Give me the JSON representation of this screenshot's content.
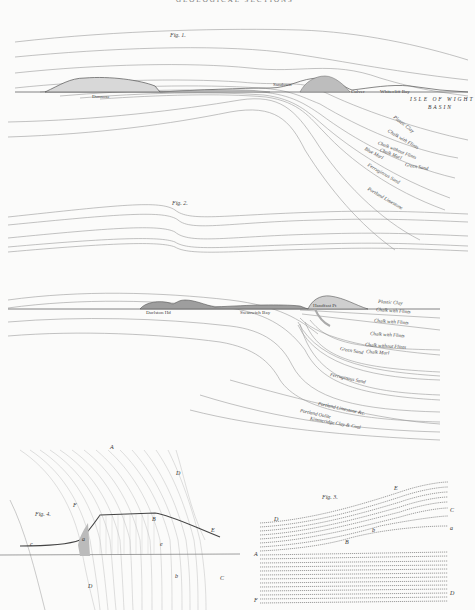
{
  "header": {
    "title": "GEOLOGICAL SECTIONS"
  },
  "figures": [
    {
      "id": "fig1",
      "label": "Fig. 1.",
      "places": [
        "Dunnose",
        "Sandown",
        "Culver",
        "Whitecliff Bay"
      ],
      "region": [
        "ISLE OF WIGHT",
        "BASIN"
      ],
      "strata": [
        "Plastic Clay",
        "Chalk with Flints",
        "Chalk without Flints",
        "Chalk Marl",
        "Green Sand",
        "Blue Marl",
        "Ferruginous Sand",
        "Portland Limestone"
      ]
    },
    {
      "id": "fig2",
      "label": "Fig. 2.",
      "places": [
        "Durlston Hd",
        "Swanwich Bay",
        "Handfast Pt"
      ],
      "strata": [
        "Plastic Clay",
        "Chalk with Flints",
        "Chalk with Flints",
        "Chalk with Flints",
        "Chalk without Flints",
        "Chalk Marl",
        "Green Sand",
        "Ferruginous Sand",
        "Portland Limestone &c.",
        "Portland Oolite",
        "Kimmeridge Clay & Coal"
      ]
    },
    {
      "id": "fig4",
      "label": "Fig. 4.",
      "letters": [
        "A",
        "D",
        "F",
        "B",
        "E",
        "c",
        "a",
        "e",
        "D",
        "b",
        "C"
      ]
    },
    {
      "id": "fig3",
      "label": "Fig. 3.",
      "letters": [
        "E",
        "D",
        "C",
        "a",
        "b",
        "B",
        "A",
        "D",
        "F"
      ]
    }
  ]
}
